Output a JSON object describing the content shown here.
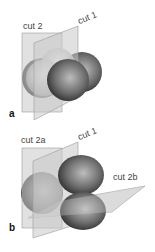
{
  "panels": [
    {
      "id": "a",
      "label": "a",
      "cuts": [
        "cut 2",
        "cut 1"
      ]
    },
    {
      "id": "b",
      "label": "b",
      "cuts": [
        "cut 2a",
        "cut 1",
        "cut 2b"
      ]
    }
  ],
  "colors": {
    "plane_fill": "#c8c8c8",
    "plane_stroke": "#9a9a9a",
    "sphere_dark": "#3a3a3a",
    "sphere_light": "#d8d8d8",
    "label": "#444444"
  }
}
